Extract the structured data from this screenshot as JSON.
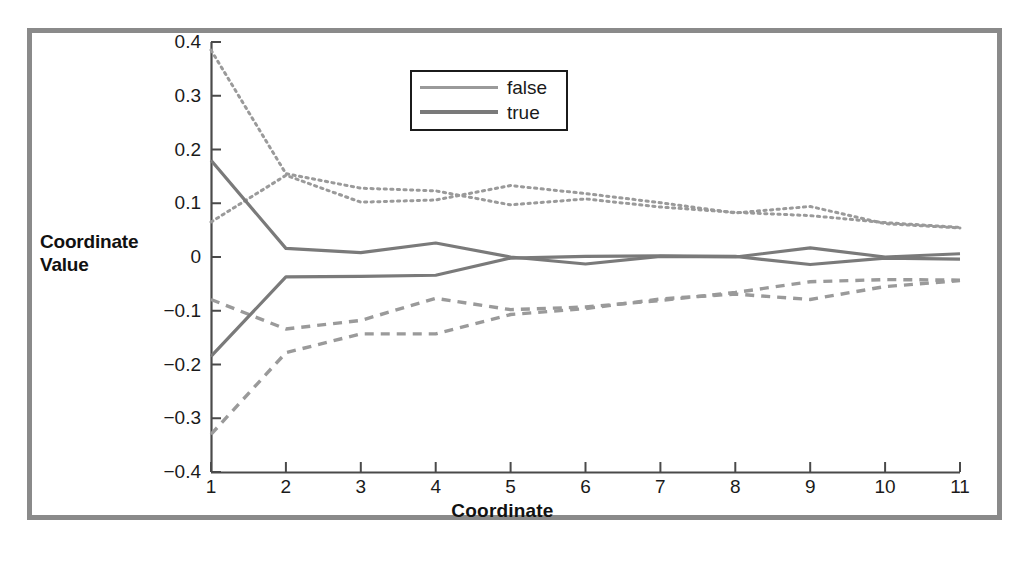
{
  "figure": {
    "border_color": "#8a8a8a",
    "background": "#ffffff"
  },
  "legend": {
    "entries": [
      {
        "label": "false",
        "color": "#9a9a9a"
      },
      {
        "label": "true",
        "color": "#7a7a7a"
      }
    ],
    "position": "top-center"
  },
  "chart_data": {
    "type": "line",
    "title": "",
    "xlabel": "Coordinate",
    "ylabel": "Coordinate Value",
    "xlim": [
      1,
      11
    ],
    "ylim": [
      -0.4,
      0.4
    ],
    "grid": false,
    "x": [
      1,
      2,
      3,
      4,
      5,
      6,
      7,
      8,
      9,
      10,
      11
    ],
    "xticklabels": [
      "1",
      "2",
      "3",
      "4",
      "5",
      "6",
      "7",
      "8",
      "9",
      "10",
      "11"
    ],
    "yticklabels": [
      "0.4",
      "0.3",
      "0.2",
      "0.1",
      "0",
      "-0.1",
      "-0.2",
      "-0.3",
      "-0.4"
    ],
    "ytickvalues": [
      0.4,
      0.3,
      0.2,
      0.1,
      0,
      -0.1,
      -0.2,
      -0.3,
      -0.4
    ],
    "legend_position": "top-center",
    "series": [
      {
        "name": "false-upper-band-high",
        "style": "dotted",
        "color": "#9a9a9a",
        "values": [
          0.385,
          0.155,
          0.128,
          0.123,
          0.097,
          0.108,
          0.093,
          0.083,
          0.077,
          0.064,
          0.055
        ]
      },
      {
        "name": "false-upper-band-low",
        "style": "dotted",
        "color": "#9a9a9a",
        "values": [
          0.065,
          0.152,
          0.102,
          0.106,
          0.133,
          0.118,
          0.101,
          0.082,
          0.094,
          0.062,
          0.054
        ]
      },
      {
        "name": "false-lower-band-high",
        "style": "dashed",
        "color": "#9a9a9a",
        "values": [
          -0.079,
          -0.134,
          -0.118,
          -0.077,
          -0.098,
          -0.093,
          -0.081,
          -0.066,
          -0.046,
          -0.042,
          -0.043
        ]
      },
      {
        "name": "false-lower-band-low",
        "style": "dashed",
        "color": "#9a9a9a",
        "values": [
          -0.33,
          -0.178,
          -0.143,
          -0.143,
          -0.107,
          -0.096,
          -0.078,
          -0.069,
          -0.079,
          -0.055,
          -0.044
        ]
      },
      {
        "name": "true-upper",
        "style": "solid",
        "color": "#7a7a7a",
        "values": [
          0.18,
          0.016,
          0.008,
          0.026,
          0.0,
          -0.013,
          0.001,
          0.0,
          0.017,
          0.0,
          0.006
        ]
      },
      {
        "name": "true-lower",
        "style": "solid",
        "color": "#7a7a7a",
        "values": [
          -0.185,
          -0.037,
          -0.036,
          -0.034,
          -0.002,
          0.001,
          0.002,
          0.001,
          -0.014,
          -0.002,
          -0.004
        ]
      }
    ]
  }
}
